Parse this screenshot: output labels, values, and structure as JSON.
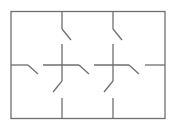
{
  "diagram": {
    "type": "floor-plan",
    "grid": {
      "columns": 3,
      "rows": 2
    },
    "line_color": "#6f6f6f",
    "outer_wall": {
      "x": 11,
      "y": 11.5,
      "width": 154,
      "height": 107
    },
    "walls": [
      {
        "id": "v1-top",
        "x1": 62,
        "y1": 11.5,
        "x2": 62,
        "y2": 29
      },
      {
        "id": "v1-mid",
        "x1": 62,
        "y1": 44,
        "x2": 62,
        "y2": 81
      },
      {
        "id": "v1-bottom",
        "x1": 62,
        "y1": 98,
        "x2": 62,
        "y2": 118.5
      },
      {
        "id": "v2-top",
        "x1": 113,
        "y1": 11.5,
        "x2": 113,
        "y2": 29
      },
      {
        "id": "v2-mid",
        "x1": 113,
        "y1": 44,
        "x2": 113,
        "y2": 81
      },
      {
        "id": "v2-bottom",
        "x1": 113,
        "y1": 98,
        "x2": 113,
        "y2": 118.5
      },
      {
        "id": "h-left",
        "x1": 11,
        "y1": 65,
        "x2": 28,
        "y2": 65
      },
      {
        "id": "h-mid-l",
        "x1": 43,
        "y1": 65,
        "x2": 79,
        "y2": 65
      },
      {
        "id": "h-mid-r",
        "x1": 94,
        "y1": 65,
        "x2": 129,
        "y2": 65
      },
      {
        "id": "h-right",
        "x1": 145,
        "y1": 65,
        "x2": 165,
        "y2": 65
      }
    ],
    "doors": [
      {
        "id": "door-top-left",
        "x1": 62,
        "y1": 29,
        "x2": 71,
        "y2": 40
      },
      {
        "id": "door-top-right",
        "x1": 113,
        "y1": 29,
        "x2": 122,
        "y2": 40
      },
      {
        "id": "door-left",
        "x1": 28,
        "y1": 65,
        "x2": 38,
        "y2": 74
      },
      {
        "id": "door-center-left",
        "x1": 79,
        "y1": 65,
        "x2": 89,
        "y2": 74
      },
      {
        "id": "door-center-right",
        "x1": 129,
        "y1": 65,
        "x2": 139,
        "y2": 74
      },
      {
        "id": "door-bottom-left",
        "x1": 62,
        "y1": 81,
        "x2": 53,
        "y2": 92
      },
      {
        "id": "door-bottom-right",
        "x1": 113,
        "y1": 81,
        "x2": 104,
        "y2": 92
      }
    ]
  }
}
